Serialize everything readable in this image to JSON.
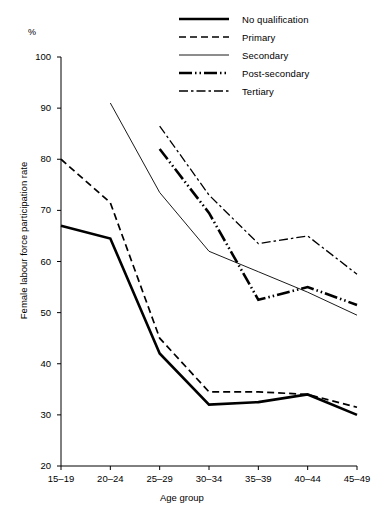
{
  "chart_data": {
    "type": "line",
    "title": "",
    "xlabel": "Age group",
    "ylabel": "Female labour force participation rate",
    "unit_label": "%",
    "categories": [
      "15–19",
      "20–24",
      "25–29",
      "30–34",
      "35–39",
      "40–44",
      "45–49"
    ],
    "ylim": [
      20,
      100
    ],
    "yticks": [
      20,
      30,
      40,
      50,
      60,
      70,
      80,
      90,
      100
    ],
    "grid": false,
    "legend_position": "top-right",
    "series": [
      {
        "name": "No qualification",
        "style": "solid-thick",
        "values": [
          67,
          64.5,
          42,
          32,
          32.5,
          34,
          30
        ]
      },
      {
        "name": "Primary",
        "style": "dashed",
        "values": [
          80,
          71.5,
          45,
          34.5,
          34.5,
          34,
          31.5
        ]
      },
      {
        "name": "Secondary",
        "style": "solid-thin",
        "values": [
          null,
          91,
          73.5,
          62,
          58,
          54,
          49.5
        ]
      },
      {
        "name": "Post-secondary",
        "style": "dash-dot-dot-thick",
        "values": [
          null,
          null,
          82,
          69.5,
          52.5,
          55,
          51.5
        ]
      },
      {
        "name": "Tertiary",
        "style": "dash-dot-thin",
        "values": [
          null,
          null,
          86.5,
          73,
          63.5,
          65,
          57.5
        ]
      }
    ]
  },
  "legend": {
    "items": [
      {
        "label": "No qualification"
      },
      {
        "label": "Primary"
      },
      {
        "label": "Secondary"
      },
      {
        "label": "Post-secondary"
      },
      {
        "label": "Tertiary"
      }
    ]
  },
  "axes": {
    "y_unit": "%",
    "y_title": "Female labour force participation rate",
    "x_title": "Age group",
    "y_ticks": [
      "100",
      "90",
      "80",
      "70",
      "60",
      "50",
      "40",
      "30",
      "20"
    ],
    "x_ticks": [
      "15–19",
      "20–24",
      "25–29",
      "30–34",
      "35–39",
      "40–44",
      "45–49"
    ]
  },
  "colors": {
    "ink": "#000000",
    "background": "#ffffff"
  }
}
